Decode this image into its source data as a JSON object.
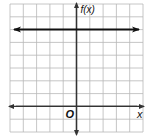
{
  "chart_data": {
    "type": "line",
    "title": "",
    "xlabel": "x",
    "ylabel": "f(x)",
    "origin_label": "O",
    "xlim": [
      -5,
      5
    ],
    "ylim": [
      -2,
      8
    ],
    "grid": true,
    "grid_step": 1,
    "series": [
      {
        "name": "f(x) = 6",
        "x": [
          -5,
          5
        ],
        "y": [
          6,
          6
        ],
        "arrows": "both"
      }
    ]
  },
  "colors": {
    "grid": "#b8b8b8",
    "axis": "#333333",
    "line": "#111111",
    "background": "#ffffff"
  }
}
